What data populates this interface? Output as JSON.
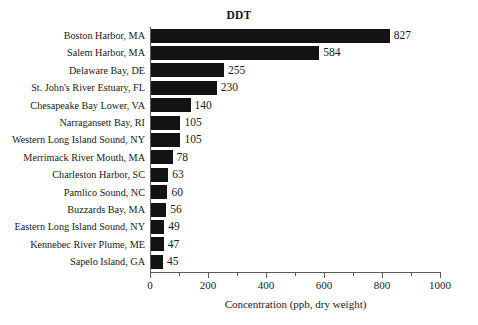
{
  "chart_data": {
    "type": "bar",
    "orientation": "horizontal",
    "title": "DDT",
    "xlabel": "Concentration (ppb, dry weight)",
    "ylabel": "",
    "xlim": [
      0,
      1000
    ],
    "grid": false,
    "legend": null,
    "bar_color": "#131313",
    "axis_color": "#5a5a5a",
    "background": "#ffffff",
    "x_ticks": [
      0,
      200,
      400,
      600,
      800,
      1000
    ],
    "x_tick_labels": [
      "0",
      "200",
      "400",
      "600",
      "800",
      "1000"
    ],
    "x_minor_ticks": [
      100,
      300,
      500,
      700,
      900
    ],
    "categories": [
      "Boston Harbor, MA",
      "Salem Harbor, MA",
      "Delaware Bay, DE",
      "St. John's River Estuary, FL",
      "Chesapeake Bay Lower, VA",
      "Narragansett Bay, RI",
      "Western Long Island Sound, NY",
      "Merrimack River Mouth, MA",
      "Charleston Harbor, SC",
      "Pamlico Sound, NC",
      "Buzzards Bay, MA",
      "Eastern Long Island Sound, NY",
      "Kennebec River Plume, ME",
      "Sapelo Island, GA"
    ],
    "values": [
      827,
      584,
      255,
      230,
      140,
      105,
      105,
      78,
      63,
      60,
      56,
      49,
      47,
      45
    ],
    "value_labels": [
      "827",
      "584",
      "255",
      "230",
      "140",
      "105",
      "105",
      "78",
      "63",
      "60",
      "56",
      "49",
      "47",
      "45"
    ]
  }
}
